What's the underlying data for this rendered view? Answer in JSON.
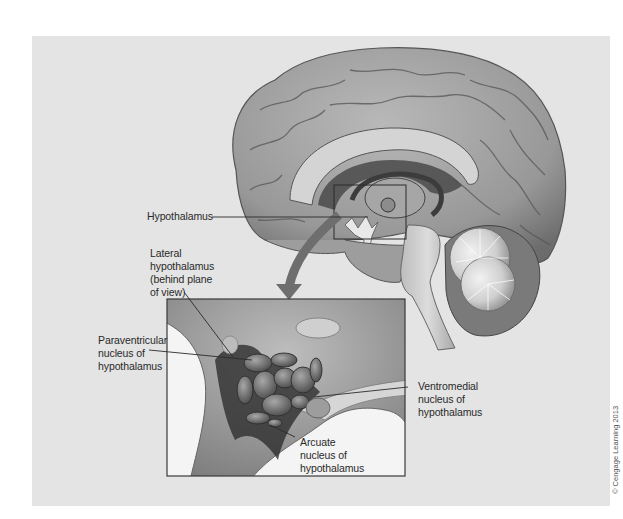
{
  "figure": {
    "colors": {
      "background": "#ffffff",
      "panel": "#e4e4e4",
      "brain_tissue": "#9a9a9a",
      "brain_highlight": "#c8c8c8",
      "arrow": "#6e6e6e",
      "inset_border": "#3a3a3a",
      "leader_line": "#2a2a2a"
    },
    "labels": {
      "hypothalamus": "Hypothalamus",
      "lateral": [
        "Lateral",
        "hypothalamus",
        "(behind plane",
        "of view)"
      ],
      "paraventricular": [
        "Paraventricular",
        "nucleus of",
        "hypothalamus"
      ],
      "ventromedial": [
        "Ventromedial",
        "nucleus of",
        "hypothalamus"
      ],
      "arcuate": [
        "Arcuate",
        "nucleus of",
        "hypothalamus"
      ]
    },
    "views": {
      "main": "Sagittal section of human brain",
      "inset": "Enlarged view of hypothalamus"
    },
    "icons": {
      "zoom_arrow": "curved-down-arrow-icon"
    },
    "copyright": "© Cengage Learning 2013"
  }
}
